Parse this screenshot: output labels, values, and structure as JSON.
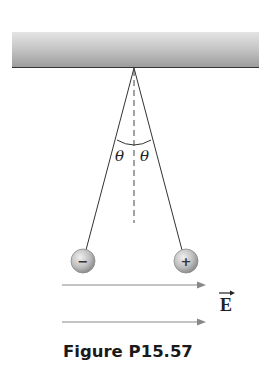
{
  "figure": {
    "caption": "Figure P15.57",
    "angle_label_left": "θ",
    "angle_label_right": "θ",
    "field_label": "E",
    "field_vector_arrow": "→",
    "charges": [
      {
        "sign": "−",
        "label": "negative-charge"
      },
      {
        "sign": "+",
        "label": "positive-charge"
      }
    ],
    "colors": {
      "ceiling_top": "#e2e2e2",
      "ceiling_bottom": "#9a9a9a",
      "string": "#333333",
      "field_arrow": "#888888",
      "sphere_light": "#e6e6e6",
      "sphere_dark": "#8a8a8a"
    }
  }
}
